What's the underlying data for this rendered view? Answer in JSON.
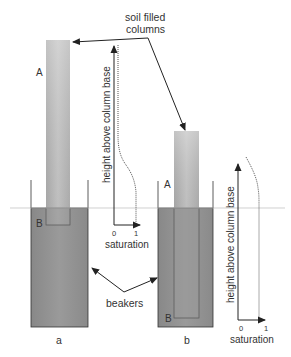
{
  "labels": {
    "soil_filled_line1": "soil filled",
    "soil_filled_line2": "columns",
    "beakers": "beakers",
    "panel_a": "a",
    "panel_b": "b",
    "point_a_col_a": "A",
    "point_b_col_a": "B",
    "point_a_col_b": "A",
    "point_b_col_b": "B"
  },
  "plot_a": {
    "ylabel": "height above column base",
    "xlabel": "saturation",
    "tick_0": "0",
    "tick_1": "1"
  },
  "plot_b": {
    "ylabel": "height above column base",
    "xlabel": "saturation",
    "tick_0": "0",
    "tick_1": "1"
  },
  "colors": {
    "water": "#8e8e8e",
    "column_light": "#d4d4d4",
    "column_dark": "#a8a8a8",
    "outline": "#333333",
    "waterline": "#bbbbbb"
  }
}
